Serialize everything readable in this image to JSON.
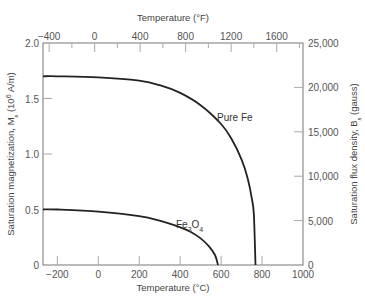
{
  "chart_data": {
    "type": "line",
    "title": "",
    "xlabel": "Temperature (°C)",
    "x2label": "Temperature (°F)",
    "ylabel": "Saturation magnetization, M_s (10^6 A/m)",
    "y2label": "Saturation flux density, B_s (gauss)",
    "xlim": [
      -270,
      1000
    ],
    "ylim": [
      0,
      2.0
    ],
    "x_ticks": [
      -200,
      0,
      200,
      400,
      600,
      800,
      1000
    ],
    "x2_ticks": [
      -400,
      0,
      400,
      800,
      1200,
      1600
    ],
    "y_ticks": [
      "0",
      "0.5",
      "1.0",
      "1.5",
      "2.0"
    ],
    "y2_ticks": [
      "0",
      "5,000",
      "10,000",
      "15,000",
      "20,000",
      "25,000"
    ],
    "grid": false,
    "series": [
      {
        "name": "Pure Fe",
        "x": [
          -270,
          -200,
          0,
          200,
          300,
          400,
          500,
          600,
          650,
          700,
          730,
          750,
          760,
          768
        ],
        "values": [
          1.7,
          1.7,
          1.69,
          1.66,
          1.62,
          1.55,
          1.44,
          1.27,
          1.14,
          0.95,
          0.78,
          0.6,
          0.45,
          0.0
        ]
      },
      {
        "name": "Fe3O4",
        "x": [
          -270,
          -200,
          0,
          200,
          300,
          400,
          450,
          500,
          540,
          570,
          585
        ],
        "values": [
          0.5,
          0.5,
          0.48,
          0.44,
          0.4,
          0.34,
          0.3,
          0.24,
          0.17,
          0.09,
          0.0
        ]
      }
    ]
  },
  "labels": {
    "top_axis_title": "Temperature (°F)",
    "bottom_axis_title": "Temperature (°C)",
    "left_axis_title": "Saturation magnetization, M",
    "left_axis_sub": "s",
    "left_axis_unit": " (10",
    "left_axis_sup": "6",
    "left_axis_unit2": " A/m)",
    "right_axis_title": "Saturation flux density, B",
    "right_axis_sub": "s",
    "right_axis_unit": " (gauss)",
    "pure_fe": "Pure Fe",
    "fe3o4_a": "Fe",
    "fe3o4_b": "3",
    "fe3o4_c": "O",
    "fe3o4_d": "4"
  }
}
